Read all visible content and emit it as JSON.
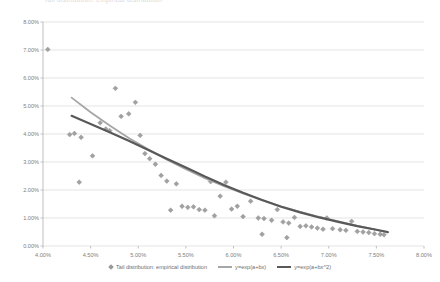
{
  "title": "Tail distribution: empirical distribution",
  "legend": {
    "position": "bottom",
    "items": [
      {
        "label": "Tail distribution: empirical distribution",
        "kind": "marker",
        "color": "#9a9a9a"
      },
      {
        "label": "y=exp(a+bx)",
        "kind": "line",
        "color": "#a6a6a6"
      },
      {
        "label": "y=exp(a+bx^2)",
        "kind": "line",
        "color": "#595959"
      }
    ]
  },
  "chart_data": {
    "type": "scatter",
    "title": "Tail distribution: empirical distribution",
    "xlabel": "",
    "ylabel": "",
    "xlim": [
      4.0,
      8.0
    ],
    "ylim": [
      0.0,
      8.0
    ],
    "grid": true,
    "x_ticks": [
      "4.00%",
      "4.50%",
      "5.00%",
      "5.50%",
      "6.00%",
      "6.50%",
      "7.00%",
      "7.50%",
      "8.00%"
    ],
    "x_tick_values": [
      4.0,
      4.5,
      5.0,
      5.5,
      6.0,
      6.5,
      7.0,
      7.5,
      8.0
    ],
    "y_ticks": [
      "0.00%",
      "1.00%",
      "2.00%",
      "3.00%",
      "4.00%",
      "5.00%",
      "6.00%",
      "7.00%",
      "8.00%"
    ],
    "y_tick_values": [
      0.0,
      1.0,
      2.0,
      3.0,
      4.0,
      5.0,
      6.0,
      7.0,
      8.0
    ],
    "series": [
      {
        "name": "Tail distribution: empirical distribution",
        "type": "scatter",
        "color": "#9a9a9a",
        "marker": "diamond",
        "points": [
          [
            4.05,
            7.02
          ],
          [
            4.28,
            3.98
          ],
          [
            4.33,
            4.02
          ],
          [
            4.4,
            3.88
          ],
          [
            4.52,
            3.22
          ],
          [
            4.6,
            4.4
          ],
          [
            4.66,
            4.18
          ],
          [
            4.7,
            4.12
          ],
          [
            4.76,
            5.63
          ],
          [
            4.82,
            4.63
          ],
          [
            4.9,
            4.72
          ],
          [
            4.97,
            5.13
          ],
          [
            5.02,
            3.95
          ],
          [
            5.07,
            3.3
          ],
          [
            5.12,
            3.12
          ],
          [
            5.18,
            2.92
          ],
          [
            5.24,
            2.52
          ],
          [
            5.3,
            2.32
          ],
          [
            5.34,
            1.28
          ],
          [
            5.4,
            2.22
          ],
          [
            5.46,
            1.42
          ],
          [
            5.52,
            1.38
          ],
          [
            5.58,
            1.4
          ],
          [
            5.64,
            1.3
          ],
          [
            5.7,
            1.28
          ],
          [
            5.76,
            2.3
          ],
          [
            5.8,
            1.08
          ],
          [
            5.86,
            1.78
          ],
          [
            5.92,
            2.28
          ],
          [
            5.98,
            1.32
          ],
          [
            6.04,
            1.42
          ],
          [
            6.1,
            1.05
          ],
          [
            6.18,
            1.6
          ],
          [
            6.26,
            1.0
          ],
          [
            6.32,
            0.98
          ],
          [
            6.4,
            0.92
          ],
          [
            6.46,
            1.3
          ],
          [
            6.52,
            0.86
          ],
          [
            6.58,
            0.82
          ],
          [
            6.64,
            1.02
          ],
          [
            6.7,
            0.7
          ],
          [
            6.76,
            0.72
          ],
          [
            6.82,
            0.68
          ],
          [
            6.88,
            0.64
          ],
          [
            6.94,
            0.6
          ],
          [
            6.98,
            1.0
          ],
          [
            7.04,
            0.62
          ],
          [
            7.12,
            0.58
          ],
          [
            7.18,
            0.56
          ],
          [
            7.24,
            0.88
          ],
          [
            7.3,
            0.52
          ],
          [
            7.36,
            0.5
          ],
          [
            7.42,
            0.48
          ],
          [
            7.48,
            0.44
          ],
          [
            7.54,
            0.42
          ],
          [
            7.58,
            0.4
          ],
          [
            4.38,
            2.28
          ],
          [
            6.3,
            0.42
          ],
          [
            6.56,
            0.3
          ]
        ]
      },
      {
        "name": "y=exp(a+bx)",
        "type": "line",
        "color": "#a6a6a6",
        "width": 1.8,
        "points": [
          [
            4.3,
            5.3
          ],
          [
            4.5,
            4.78
          ],
          [
            4.7,
            4.3
          ],
          [
            4.9,
            3.86
          ],
          [
            5.1,
            3.46
          ],
          [
            5.3,
            3.08
          ],
          [
            5.5,
            2.74
          ],
          [
            5.7,
            2.42
          ],
          [
            5.9,
            2.14
          ],
          [
            6.1,
            1.88
          ],
          [
            6.3,
            1.64
          ],
          [
            6.5,
            1.42
          ],
          [
            6.7,
            1.22
          ],
          [
            6.9,
            1.04
          ],
          [
            7.1,
            0.88
          ],
          [
            7.3,
            0.72
          ],
          [
            7.5,
            0.58
          ],
          [
            7.62,
            0.48
          ]
        ]
      },
      {
        "name": "y=exp(a+bx^2)",
        "type": "line",
        "color": "#595959",
        "width": 2.2,
        "points": [
          [
            4.3,
            4.65
          ],
          [
            4.5,
            4.36
          ],
          [
            4.7,
            4.06
          ],
          [
            4.9,
            3.76
          ],
          [
            5.1,
            3.44
          ],
          [
            5.3,
            3.12
          ],
          [
            5.5,
            2.8
          ],
          [
            5.7,
            2.48
          ],
          [
            5.9,
            2.18
          ],
          [
            6.1,
            1.9
          ],
          [
            6.3,
            1.64
          ],
          [
            6.5,
            1.4
          ],
          [
            6.7,
            1.2
          ],
          [
            6.9,
            1.02
          ],
          [
            7.1,
            0.86
          ],
          [
            7.3,
            0.71
          ],
          [
            7.5,
            0.58
          ],
          [
            7.62,
            0.5
          ]
        ]
      }
    ]
  }
}
